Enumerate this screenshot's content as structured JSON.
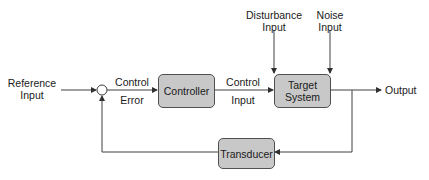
{
  "diagram": {
    "type": "feedback-control-block-diagram",
    "colors": {
      "block_fill": "#c8c8c8",
      "block_border": "#505050",
      "line": "#404040",
      "text": "#1a1a1a"
    },
    "blocks": {
      "controller": {
        "label": "Controller"
      },
      "target_system": {
        "label_line1": "Target",
        "label_line2": "System"
      },
      "transducer": {
        "label": "Transducer"
      }
    },
    "labels": {
      "reference_input": {
        "line1": "Reference",
        "line2": "Input"
      },
      "control_error": {
        "line1": "Control",
        "line2": "Error"
      },
      "control_input": {
        "line1": "Control",
        "line2": "Input"
      },
      "disturbance_input": {
        "line1": "Disturbance",
        "line2": "Input"
      },
      "noise_input": {
        "line1": "Noise",
        "line2": "Input"
      },
      "output": "Output"
    },
    "nodes": [
      "summing-junction"
    ],
    "edges": [
      {
        "from": "Reference Input",
        "to": "summing-junction"
      },
      {
        "from": "summing-junction",
        "to": "Controller",
        "label": "Control Error"
      },
      {
        "from": "Controller",
        "to": "Target System",
        "label": "Control Input"
      },
      {
        "from": "Disturbance Input",
        "to": "Target System"
      },
      {
        "from": "Noise Input",
        "to": "Target System"
      },
      {
        "from": "Target System",
        "to": "Output"
      },
      {
        "from": "Target System",
        "to": "Transducer"
      },
      {
        "from": "Transducer",
        "to": "summing-junction"
      }
    ]
  }
}
